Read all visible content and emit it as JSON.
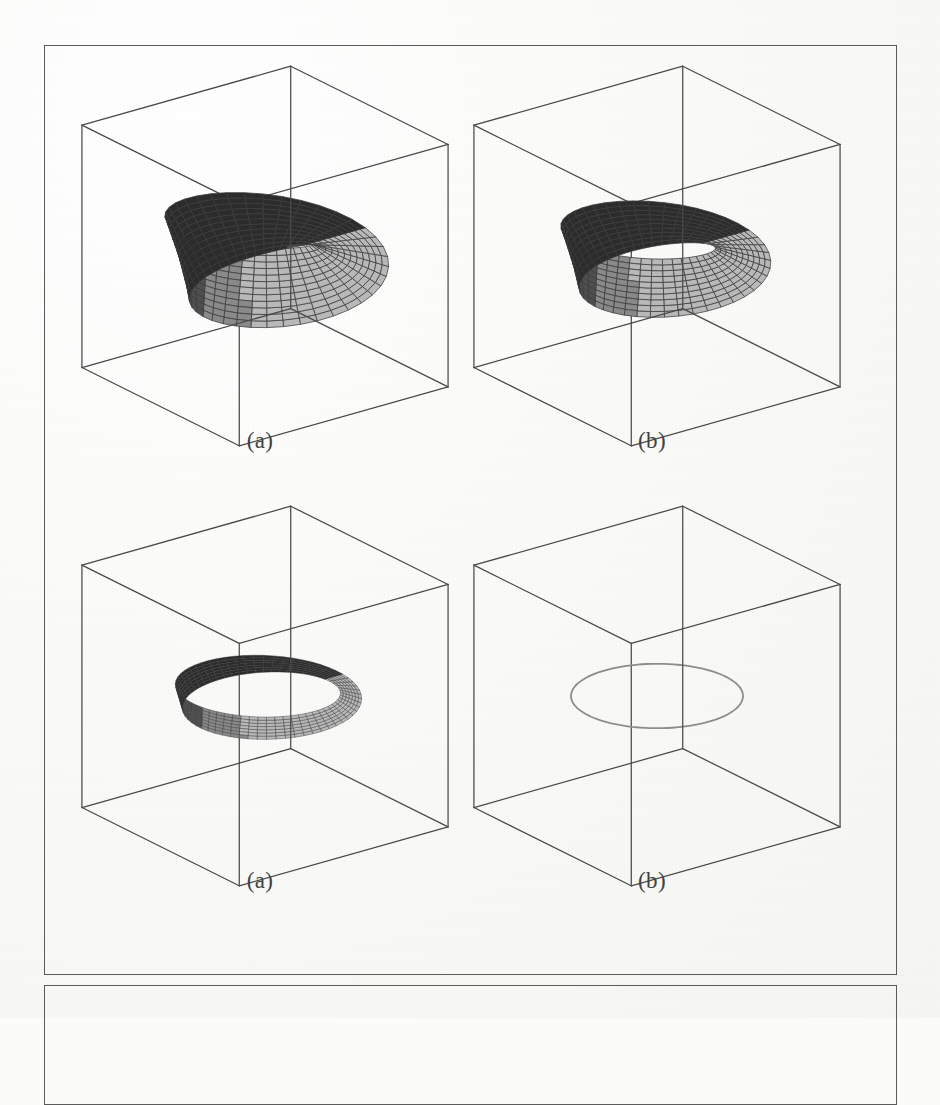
{
  "page": {
    "background_color": "#fbfbf9",
    "ink_color": "#4a4a4a",
    "frames": [
      {
        "name": "main-figure-frame",
        "x": 44,
        "y": 45,
        "width": 853,
        "height": 930
      },
      {
        "name": "second-figure-frame",
        "x": 44,
        "y": 985,
        "width": 853,
        "height": 120
      }
    ]
  },
  "panels": [
    {
      "id": "panel-tl",
      "caption": "(a)",
      "surface": "mobius-band-thick",
      "tube_radius": 0.46,
      "mesh": true,
      "mesh_u": 40,
      "mesh_v": 12,
      "twist_half_turns": 1,
      "ring_radius": 1.0,
      "view_azimuth": -37,
      "view_elevation": 22
    },
    {
      "id": "panel-tr",
      "caption": "(b)",
      "surface": "mobius-band-medium",
      "tube_radius": 0.34,
      "mesh": true,
      "mesh_u": 44,
      "mesh_v": 10,
      "twist_half_turns": 1,
      "ring_radius": 1.0,
      "view_azimuth": -37,
      "view_elevation": 22
    },
    {
      "id": "panel-bl",
      "caption": "(a)",
      "surface": "mobius-band-thin",
      "tube_radius": 0.13,
      "mesh": true,
      "mesh_u": 60,
      "mesh_v": 7,
      "twist_half_turns": 1,
      "ring_radius": 1.0,
      "view_azimuth": -37,
      "view_elevation": 22
    },
    {
      "id": "panel-br",
      "caption": "(b)",
      "surface": "degenerate-circle",
      "tube_radius": 0.0,
      "mesh": false,
      "mesh_u": 120,
      "mesh_v": 1,
      "twist_half_turns": 1,
      "ring_radius": 1.0,
      "view_azimuth": -37,
      "view_elevation": 22
    }
  ],
  "chart_data": {
    "type": "surface",
    "title": "",
    "subtitle": "",
    "xlabel": "",
    "ylabel": "",
    "zlabel": "",
    "grid": false,
    "legend": "none",
    "note": "Four 3-D parametric surface plots of a twisted annulus (Mobius-type band) inside a wireframe unit bounding box, shown for decreasing tube radius; the fourth degenerates to a single circle.",
    "axis_box": {
      "xlim": [
        -1,
        1
      ],
      "ylim": [
        -1,
        1
      ],
      "zlim": [
        -1,
        1
      ]
    },
    "series": [
      {
        "name": "(a) thick band",
        "tube_radius": 0.46,
        "shading": "gray-mesh"
      },
      {
        "name": "(b) medium band",
        "tube_radius": 0.34,
        "shading": "gray-mesh"
      },
      {
        "name": "(a) thin band",
        "tube_radius": 0.13,
        "shading": "gray-mesh"
      },
      {
        "name": "(b) circle",
        "tube_radius": 0.0,
        "shading": "outline"
      }
    ],
    "captions": [
      "(a)",
      "(b)",
      "(a)",
      "(b)"
    ]
  },
  "colors": {
    "ink": "#4a4a4a",
    "paper": "#fbfbf9",
    "mesh_line": "#3b3b3b",
    "face_light": "#b9b9b9",
    "face_mid": "#8a8a8a",
    "face_dark": "#4f4f4f",
    "face_darkest": "#2c2c2c",
    "outline": "#8d8d8d"
  }
}
